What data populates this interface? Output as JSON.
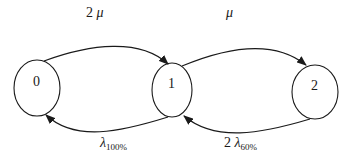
{
  "diagram": {
    "type": "state-transition (birth-death Markov chain)",
    "states": [
      {
        "id": "0",
        "label": "0"
      },
      {
        "id": "1",
        "label": "1"
      },
      {
        "id": "2",
        "label": "2"
      }
    ],
    "transitions": [
      {
        "from": "0",
        "to": "1",
        "direction": "forward",
        "label_coef": "2",
        "label_symbol": "μ",
        "label_sub": ""
      },
      {
        "from": "1",
        "to": "2",
        "direction": "forward",
        "label_coef": "",
        "label_symbol": "μ",
        "label_sub": ""
      },
      {
        "from": "1",
        "to": "0",
        "direction": "backward",
        "label_coef": "",
        "label_symbol": "λ",
        "label_sub": "100%"
      },
      {
        "from": "2",
        "to": "1",
        "direction": "backward",
        "label_coef": "2",
        "label_symbol": "λ",
        "label_sub": "60%"
      }
    ],
    "colors": {
      "stroke": "#1a1a1a",
      "background": "#ffffff"
    }
  }
}
